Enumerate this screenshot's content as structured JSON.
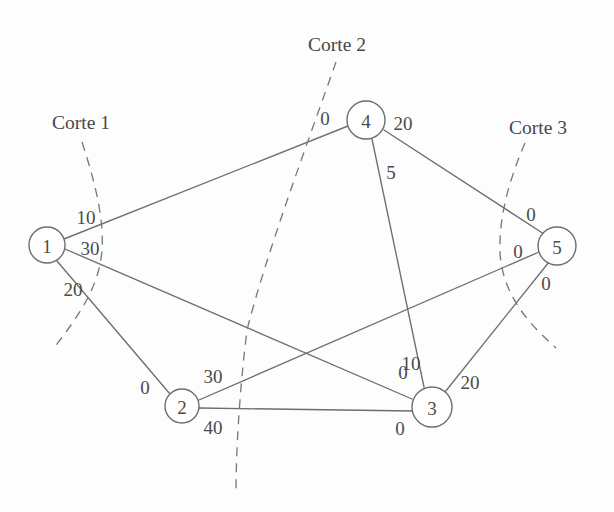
{
  "figure": {
    "background_color": "#fdfdfd",
    "stroke_color": "#6e6e6e",
    "text_color": "#4b4b4b",
    "width": 614,
    "height": 512
  },
  "nodes": [
    {
      "id": "1",
      "label": "1",
      "cx": 47,
      "cy": 245,
      "r": 18
    },
    {
      "id": "2",
      "label": "2",
      "cx": 182,
      "cy": 406,
      "r": 17
    },
    {
      "id": "3",
      "label": "3",
      "cx": 432,
      "cy": 407,
      "r": 20
    },
    {
      "id": "4",
      "label": "4",
      "cx": 366,
      "cy": 120,
      "r": 19
    },
    {
      "id": "5",
      "label": "5",
      "cx": 557,
      "cy": 246,
      "r": 19
    }
  ],
  "edges": [
    {
      "id": "e-1-4",
      "from": "1",
      "to": "4",
      "x1": 64,
      "y1": 239,
      "x2": 348,
      "y2": 126,
      "labels": [
        {
          "text": "10",
          "x": 86,
          "y": 217
        },
        {
          "text": "0",
          "x": 325,
          "y": 118
        }
      ]
    },
    {
      "id": "e-1-3",
      "from": "1",
      "to": "3",
      "x1": 65,
      "y1": 249,
      "x2": 412,
      "y2": 399,
      "labels": [
        {
          "text": "30",
          "x": 90,
          "y": 248
        },
        {
          "text": "0",
          "x": 403,
          "y": 372
        }
      ]
    },
    {
      "id": "e-1-2",
      "from": "1",
      "to": "2",
      "x1": 57,
      "y1": 261,
      "x2": 170,
      "y2": 394,
      "labels": [
        {
          "text": "20",
          "x": 73,
          "y": 289
        },
        {
          "text": "0",
          "x": 145,
          "y": 387
        }
      ]
    },
    {
      "id": "e-2-5",
      "from": "2",
      "to": "5",
      "x1": 199,
      "y1": 400,
      "x2": 539,
      "y2": 252,
      "labels": [
        {
          "text": "30",
          "x": 213,
          "y": 376
        },
        {
          "text": "0",
          "x": 518,
          "y": 251
        }
      ]
    },
    {
      "id": "e-2-3",
      "from": "2",
      "to": "3",
      "x1": 199,
      "y1": 408,
      "x2": 412,
      "y2": 411,
      "labels": [
        {
          "text": "40",
          "x": 213,
          "y": 427
        },
        {
          "text": "0",
          "x": 400,
          "y": 428
        }
      ]
    },
    {
      "id": "e-4-3",
      "from": "4",
      "to": "3",
      "x1": 372,
      "y1": 139,
      "x2": 424,
      "y2": 387,
      "labels": [
        {
          "text": "5",
          "x": 391,
          "y": 172
        },
        {
          "text": "10",
          "x": 411,
          "y": 363
        }
      ]
    },
    {
      "id": "e-4-5",
      "from": "4",
      "to": "5",
      "x1": 384,
      "y1": 130,
      "x2": 544,
      "y2": 234,
      "labels": [
        {
          "text": "20",
          "x": 403,
          "y": 123
        },
        {
          "text": "0",
          "x": 531,
          "y": 214
        }
      ]
    },
    {
      "id": "e-3-5",
      "from": "3",
      "to": "5",
      "x1": 445,
      "y1": 392,
      "x2": 549,
      "y2": 262,
      "labels": [
        {
          "text": "20",
          "x": 470,
          "y": 382
        },
        {
          "text": "0",
          "x": 546,
          "y": 283
        }
      ]
    }
  ],
  "cuts": [
    {
      "id": "corte-1",
      "label": "Corte 1",
      "label_x": 81,
      "label_y": 122,
      "path": "M 82 142 C 97 188, 104 222, 102 250 C 99 290, 75 320, 54 348"
    },
    {
      "id": "corte-2",
      "label": "Corte 2",
      "label_x": 337,
      "label_y": 44,
      "path": "M 336 62 C 305 150, 266 255, 247 330 C 239 395, 236 455, 236 492"
    },
    {
      "id": "corte-3",
      "label": "Corte 3",
      "label_x": 538,
      "label_y": 127,
      "path": "M 525 143 C 507 185, 499 220, 500 252 C 502 295, 530 325, 556 348"
    }
  ]
}
